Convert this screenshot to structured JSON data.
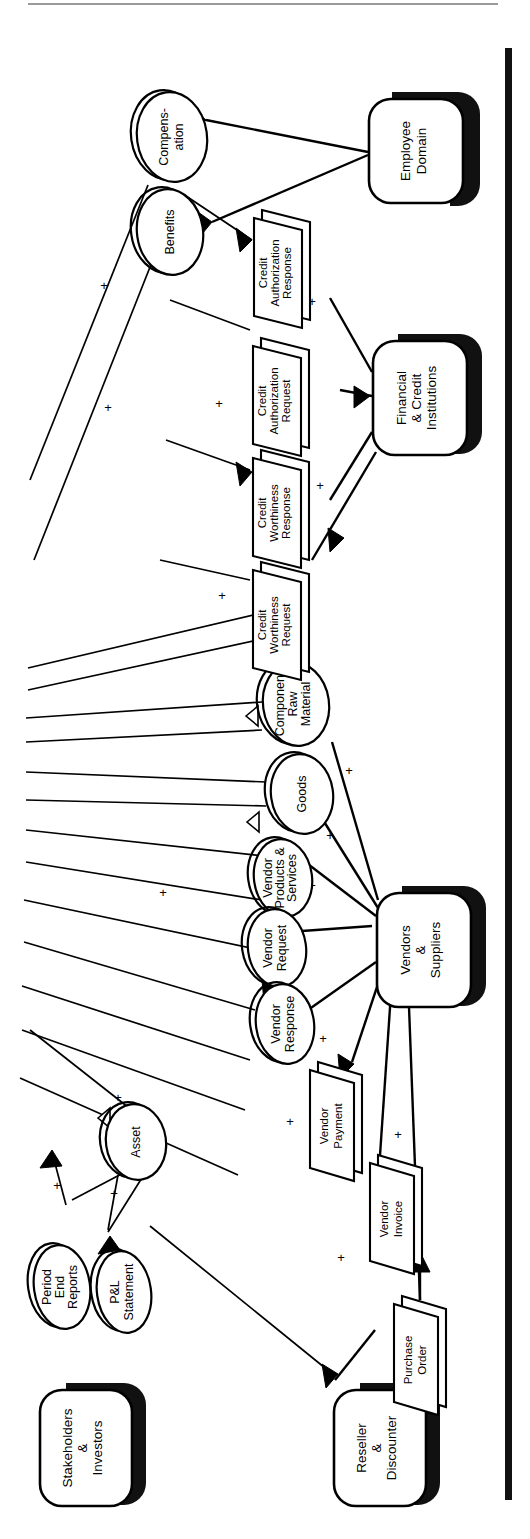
{
  "diagram": {
    "orientation": "rotated-90-ccw",
    "stroke_color": "#000000",
    "background_color": "#ffffff",
    "shadow_color": "#111111",
    "page_edge_color": "#9a9a9a"
  },
  "entities": [
    {
      "id": "employee-domain",
      "label_1": "Employee",
      "label_2": "Domain",
      "label_3": ""
    },
    {
      "id": "financial-credit",
      "label_1": "Financial",
      "label_2": "& Credit",
      "label_3": "Institutions"
    },
    {
      "id": "vendors-suppliers",
      "label_1": "Vendors",
      "label_2": "&",
      "label_3": "Suppliers"
    },
    {
      "id": "reseller-discounter",
      "label_1": "Reseller",
      "label_2": "&",
      "label_3": "Discounter"
    },
    {
      "id": "stakeholders-investors",
      "label_1": "Stakeholders",
      "label_2": "&",
      "label_3": "Investors"
    }
  ],
  "stores": [
    {
      "id": "compensation",
      "label_1": "Compens-",
      "label_2": "ation",
      "label_3": ""
    },
    {
      "id": "benefits",
      "label_1": "Benefits",
      "label_2": "",
      "label_3": ""
    },
    {
      "id": "component-raw-material",
      "label_1": "Component",
      "label_2": "Raw",
      "label_3": "Material"
    },
    {
      "id": "goods",
      "label_1": "Goods",
      "label_2": "",
      "label_3": ""
    },
    {
      "id": "vendor-products-services",
      "label_1": "Vendor",
      "label_2": "Products &",
      "label_3": "Services"
    },
    {
      "id": "vendor-request",
      "label_1": "Vendor",
      "label_2": "Request",
      "label_3": ""
    },
    {
      "id": "vendor-response",
      "label_1": "Vendor",
      "label_2": "Response",
      "label_3": ""
    },
    {
      "id": "asset",
      "label_1": "Asset",
      "label_2": "",
      "label_3": ""
    },
    {
      "id": "period-end-reports",
      "label_1": "Period",
      "label_2": "End",
      "label_3": "Reports"
    },
    {
      "id": "pl-statement",
      "label_1": "P&L",
      "label_2": "Statement",
      "label_3": ""
    }
  ],
  "flows": [
    {
      "id": "credit-authorization-response",
      "label_1": "Credit",
      "label_2": "Authorization",
      "label_3": "Response"
    },
    {
      "id": "credit-authorization-request",
      "label_1": "Credit",
      "label_2": "Authorization",
      "label_3": "Request"
    },
    {
      "id": "credit-worthiness-response",
      "label_1": "Credit",
      "label_2": "Worthiness",
      "label_3": "Response"
    },
    {
      "id": "credit-worthiness-request",
      "label_1": "Credit",
      "label_2": "Worthiness",
      "label_3": "Request"
    },
    {
      "id": "vendor-payment",
      "label_1": "Vendor",
      "label_2": "Payment",
      "label_3": ""
    },
    {
      "id": "vendor-invoice",
      "label_1": "Vendor",
      "label_2": "Invoice",
      "label_3": ""
    },
    {
      "id": "purchase-order",
      "label_1": "Purchase",
      "label_2": "Order",
      "label_3": ""
    }
  ],
  "markers": {
    "plus": "+",
    "star": "*",
    "triangle": "△"
  }
}
